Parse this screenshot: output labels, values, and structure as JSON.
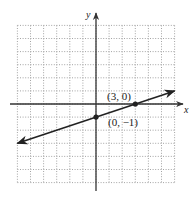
{
  "chart_data": {
    "type": "line",
    "title": "",
    "xlabel": "x",
    "ylabel": "y",
    "xlim": [
      -6,
      6
    ],
    "ylim": [
      -6,
      6
    ],
    "grid": true,
    "grid_style": "dotted",
    "tick_labels": false,
    "series": [
      {
        "name": "line",
        "equation": "y = (1/3)x - 1",
        "slope": 0.3333,
        "intercept": -1,
        "x": [
          -6,
          6
        ],
        "y": [
          -3,
          1
        ],
        "arrows": "both"
      }
    ],
    "points": [
      {
        "x": 3,
        "y": 0,
        "label": "(3, 0)"
      },
      {
        "x": 0,
        "y": -1,
        "label": "(0, −1)"
      }
    ]
  },
  "colors": {
    "grid": "#9a9a9a",
    "axis": "#333333",
    "line": "#222222"
  }
}
